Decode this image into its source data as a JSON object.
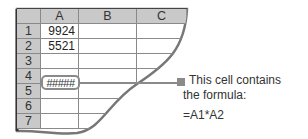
{
  "spreadsheet": {
    "columns": [
      "A",
      "B",
      "C"
    ],
    "rows": [
      "1",
      "2",
      "3",
      "4",
      "5",
      "6",
      "7"
    ],
    "cells": {
      "A1": "9924",
      "A2": "5521",
      "A4": "#####"
    }
  },
  "callout": {
    "line1": "This cell contains",
    "line2": "the formula:",
    "formula": "=A1*A2"
  },
  "colors": {
    "header_bg": "#c9c9c9",
    "gridline": "#8a8a8a",
    "marker": "#8a8a8a"
  }
}
